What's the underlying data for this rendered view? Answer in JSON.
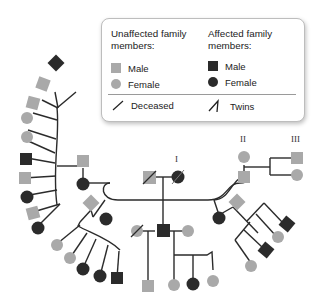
{
  "legend": {
    "unaffected_heading": "Unaffected family members:",
    "unaffected_heading_line1": "Unaffected family",
    "unaffected_heading_line2": "members:",
    "affected_heading_line1": "Affected family",
    "affected_heading_line2": "members:",
    "unaffected_male": "Male",
    "unaffected_female": "Female",
    "affected_male": "Male",
    "affected_female": "Female",
    "deceased": "Deceased",
    "twins": "Twins"
  },
  "generation_labels": {
    "I": "I",
    "II": "II",
    "III": "III"
  },
  "colors": {
    "unaffected": "#a9a9a9",
    "affected": "#2b2b2b",
    "line": "#2b2b2b"
  }
}
